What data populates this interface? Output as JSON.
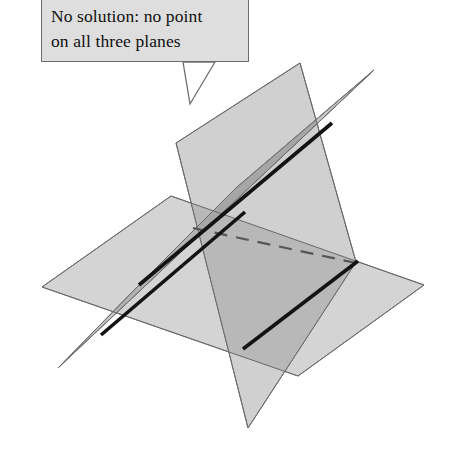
{
  "figure": {
    "callout": {
      "name": "no-solution-callout",
      "line1": "No solution: no point",
      "line2": "on all three planes",
      "box": {
        "x": 41,
        "y": 0,
        "width": 208,
        "height": 62
      },
      "fill_color": "#dedede",
      "border_color": "#6e6e6e",
      "text_color": "#101010",
      "tail_points": "13 4 20 46 45 4"
    },
    "colors": {
      "plane_light": "#d2d2d2",
      "plane_mid": "#bdbdbd",
      "plane_dark": "#a6a6a6",
      "plane_darkest": "#969696",
      "outline": "#6b6b6b",
      "intersection_line": "#131313",
      "hidden_line": "#4a4a4a",
      "background": "#ffffff"
    },
    "planes": [
      {
        "name": "horizontal-plane",
        "label": "Horizontal plane",
        "points": "42,287 171,196 424,285 298,376",
        "fill": "#d2d2d2",
        "opacity": 0.95
      },
      {
        "name": "steep-plane",
        "label": "Steep near-vertical plane",
        "points": "176,143 300,63 356,262 248,428",
        "fill": "#c6c6c6",
        "opacity": 0.9
      },
      {
        "name": "sliver-plane",
        "label": "Thin sliver plane",
        "points": "374,70 58,368 141,283 236,188",
        "fill": "#b4b4b4",
        "opacity": 0.85
      }
    ],
    "intersection_lines": [
      {
        "name": "sliver-steep-intersection-line",
        "style": "solid",
        "x1": 141,
        "y1": 283,
        "x2": 330,
        "y2": 125,
        "width": 3.4,
        "color": "#131313"
      },
      {
        "name": "sliver-horizontal-intersection-line",
        "style": "solid",
        "x1": 103,
        "y1": 333,
        "x2": 243,
        "y2": 214,
        "width": 3.4,
        "color": "#131313"
      },
      {
        "name": "steep-horizontal-intersection-line",
        "style": "solid",
        "x1": 244,
        "y1": 348,
        "x2": 357,
        "y2": 262,
        "width": 3.4,
        "color": "#131313"
      },
      {
        "name": "hidden-back-edge-dashed",
        "style": "dashed",
        "x1": 193,
        "y1": 228,
        "x2": 356,
        "y2": 263,
        "width": 2.2,
        "color": "#555555"
      }
    ]
  }
}
